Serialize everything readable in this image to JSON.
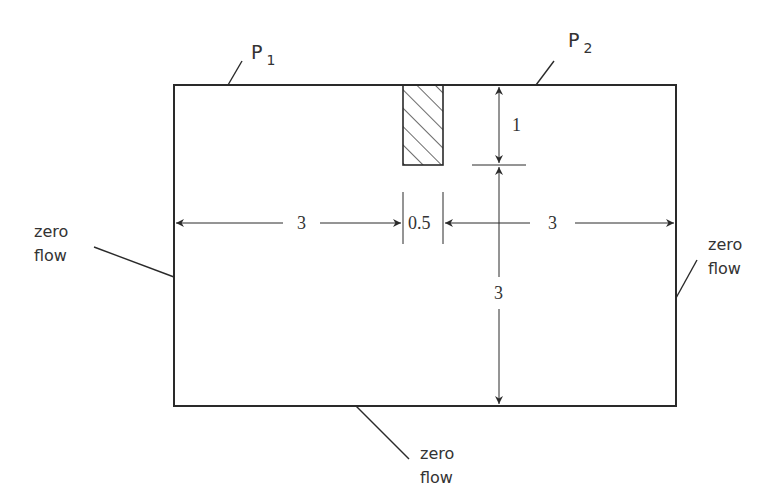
{
  "diagram": {
    "domain_box": {
      "x": 174,
      "y": 85,
      "width": 502,
      "height": 321
    },
    "obstacle": {
      "x": 403,
      "y": 85,
      "width": 40,
      "height": 80,
      "fill": "hatched"
    },
    "labels": {
      "p1": {
        "main": "P",
        "sub": "1"
      },
      "p2": {
        "main": "P",
        "sub": "2"
      },
      "left_bc": {
        "line1": "zero",
        "line2": "flow"
      },
      "right_bc": {
        "line1": "zero",
        "line2": "flow"
      },
      "bottom_bc": {
        "line1": "zero",
        "line2": "flow"
      }
    },
    "dimensions": {
      "left_width": "3",
      "obstacle_width": "0.5",
      "right_width": "3",
      "obstacle_depth": "1",
      "lower_height": "3"
    },
    "colors": {
      "stroke": "#2a2a2a",
      "text": "#333333"
    }
  }
}
